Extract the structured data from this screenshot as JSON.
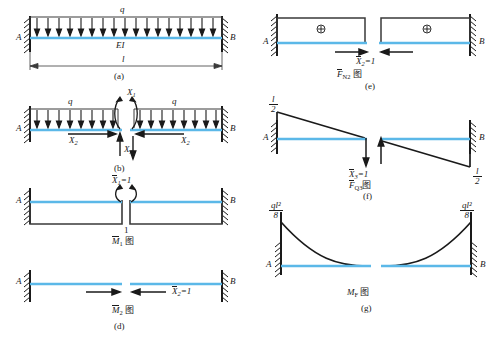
{
  "figure": {
    "colors": {
      "beam_axis": "#5bb8e8",
      "line": "#1a1a1a",
      "outline": "#3a3a3a"
    }
  },
  "panels": [
    {
      "id": "a",
      "caption": "(a)",
      "supports": [
        "A",
        "B"
      ],
      "load_label": "q",
      "stiffness_label": "EI",
      "span_label": "l",
      "description": "Fixed-fixed beam of flexural rigidity EI, span l, carrying uniform load q"
    },
    {
      "id": "b",
      "caption": "(b)",
      "supports": [
        "A",
        "B"
      ],
      "load_label_left": "q",
      "load_label_right": "q",
      "redundants": [
        {
          "symbol": "X",
          "index": "1",
          "type": "moment"
        },
        {
          "symbol": "X",
          "index": "2",
          "type": "axial"
        },
        {
          "symbol": "X",
          "index": "3",
          "type": "shear"
        }
      ],
      "description": "Primary system: mid-span cut releasing three redundants X1, X2, X3"
    },
    {
      "id": "c",
      "caption": "(c)",
      "supports": [
        "A",
        "B"
      ],
      "unit_force": "X",
      "unit_force_index": "1",
      "unit_force_value": "1",
      "ordinate": "1",
      "diagram_label": "M",
      "diagram_index": "1",
      "diagram_suffix": "图",
      "description": "Unit bending moment diagram for X1 = 1"
    },
    {
      "id": "d",
      "caption": "(d)",
      "supports": [
        "A",
        "B"
      ],
      "unit_force": "X",
      "unit_force_index": "2",
      "unit_force_value": "1",
      "diagram_label": "M",
      "diagram_index": "2",
      "diagram_suffix": "图",
      "description": "Unit bending moment diagram for X2 = 1 (zero everywhere)"
    },
    {
      "id": "e",
      "caption": "(e)",
      "supports": [
        "A",
        "B"
      ],
      "unit_force": "X",
      "unit_force_index": "2",
      "unit_force_value": "1",
      "sign_marker": "⊕",
      "diagram_label": "F",
      "diagram_index": "N2",
      "diagram_suffix": "图",
      "description": "Unit axial force diagram for X2 = 1, constant positive over the span"
    },
    {
      "id": "f",
      "caption": "(f)",
      "supports": [
        "A",
        "B"
      ],
      "unit_force": "X",
      "unit_force_index": "3",
      "unit_force_value": "1",
      "ordinate_left_num": "l",
      "ordinate_left_den": "2",
      "ordinate_right_num": "l",
      "ordinate_right_den": "2",
      "diagram_label": "F",
      "diagram_index": "Q3",
      "diagram_suffix": "图",
      "description": "Unit shear/moment diagram for X3 = 1 with end ordinates l/2"
    },
    {
      "id": "g",
      "caption": "(g)",
      "supports": [
        "A",
        "B"
      ],
      "ordinate_left_num": "ql²",
      "ordinate_left_den": "8",
      "ordinate_right_num": "ql²",
      "ordinate_right_den": "8",
      "diagram_label": "M",
      "diagram_index": "F",
      "diagram_suffix": "图",
      "description": "Bending moment diagram of the primary system under load, end values ql²/8"
    }
  ]
}
